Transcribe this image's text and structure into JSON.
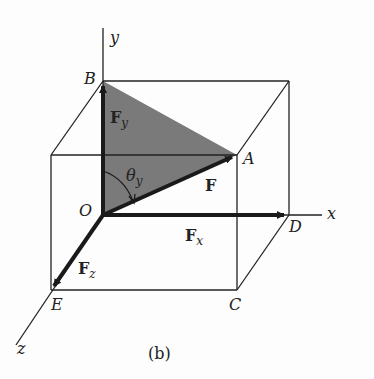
{
  "figure": {
    "caption": "(b)",
    "colors": {
      "background": "#fdfdfd",
      "line": "#222222",
      "shaded_plane": "#7a7a7a",
      "vector": "#1a1a1a"
    },
    "axes": {
      "x": "x",
      "y": "y",
      "z": "z"
    },
    "points": {
      "O": "O",
      "A": "A",
      "B": "B",
      "C": "C",
      "D": "D",
      "E": "E"
    },
    "vectors": {
      "F": "F",
      "Fx_main": "F",
      "Fx_sub": "x",
      "Fy_main": "F",
      "Fy_sub": "y",
      "Fz_main": "F",
      "Fz_sub": "z"
    },
    "angle": {
      "main": "θ",
      "sub": "y"
    }
  }
}
